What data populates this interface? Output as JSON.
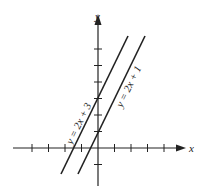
{
  "axes": {
    "x_label": "x",
    "y_label": "y",
    "origin_px": [
      98,
      148
    ],
    "tick_spacing_px": 16.5,
    "x_ticks": [
      -4,
      -3,
      -2,
      -1,
      1,
      2,
      3,
      4
    ],
    "y_ticks": [
      -1,
      1,
      2,
      3,
      4,
      5,
      6
    ]
  },
  "lines": [
    {
      "equation": "y = 2x + 3",
      "slope": 2,
      "intercept": 3
    },
    {
      "equation": "y = 2x + 1",
      "slope": 2,
      "intercept": 1
    }
  ],
  "colors": {
    "ink": "#222222",
    "background": "#ffffff"
  }
}
